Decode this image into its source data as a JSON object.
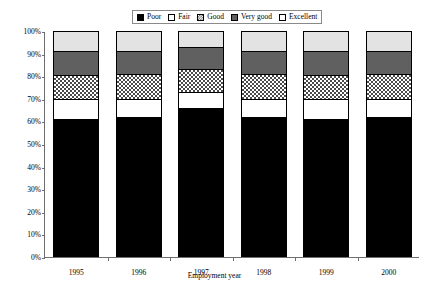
{
  "chart_data": {
    "type": "bar",
    "subtype": "stacked-100-percent",
    "title": "",
    "xlabel": "Employment year",
    "ylabel": "",
    "categories": [
      "1995",
      "1996",
      "1997",
      "1998",
      "1999",
      "2000"
    ],
    "ylim": [
      0,
      100
    ],
    "ytick_labels": [
      "0%",
      "10%",
      "20%",
      "30%",
      "40%",
      "50%",
      "60%",
      "70%",
      "80%",
      "90%",
      "100%"
    ],
    "ytick_values": [
      0,
      10,
      20,
      30,
      40,
      50,
      60,
      70,
      80,
      90,
      100
    ],
    "grid": false,
    "legend_position": "top-center",
    "legend_entries": [
      "Poor",
      "Fair",
      "Good",
      "Very good",
      "Excellent"
    ],
    "stack_order_bottom_to_top": [
      "Poor",
      "Fair",
      "Good",
      "Very good",
      "Excellent"
    ],
    "series": [
      {
        "name": "Poor",
        "pattern": "solid-black",
        "values": [
          61,
          62,
          66,
          62,
          61,
          62
        ]
      },
      {
        "name": "Fair",
        "pattern": "solid-white",
        "values": [
          9,
          8,
          7,
          8,
          9,
          8
        ]
      },
      {
        "name": "Good",
        "pattern": "checkered",
        "values": [
          10.5,
          11,
          10,
          11,
          10.5,
          11
        ]
      },
      {
        "name": "Very good",
        "pattern": "solid-darkgray",
        "values": [
          10.5,
          10,
          10,
          10,
          10.5,
          10
        ]
      },
      {
        "name": "Excellent",
        "pattern": "solid-lightgray",
        "values": [
          9,
          9,
          7,
          9,
          9,
          9
        ]
      }
    ],
    "cumulative_tops": [
      {
        "category": "1995",
        "tops": [
          61,
          70,
          80.5,
          91,
          100
        ]
      },
      {
        "category": "1996",
        "tops": [
          62,
          70,
          81,
          91,
          100
        ]
      },
      {
        "category": "1997",
        "tops": [
          66,
          73,
          83,
          93,
          100
        ]
      },
      {
        "category": "1998",
        "tops": [
          62,
          70,
          81,
          91,
          100
        ]
      },
      {
        "category": "1999",
        "tops": [
          61,
          70,
          80.5,
          91,
          100
        ]
      },
      {
        "category": "2000",
        "tops": [
          62,
          70,
          81,
          91,
          100
        ]
      }
    ],
    "colors": {
      "poor": "#000000",
      "fair": "#ffffff",
      "good": "#4a4a4a",
      "very_good": "#606060",
      "excellent": "#e3e3e3",
      "axis": "#6e6e6e",
      "outline": "#000000",
      "background": "#ffffff"
    }
  }
}
